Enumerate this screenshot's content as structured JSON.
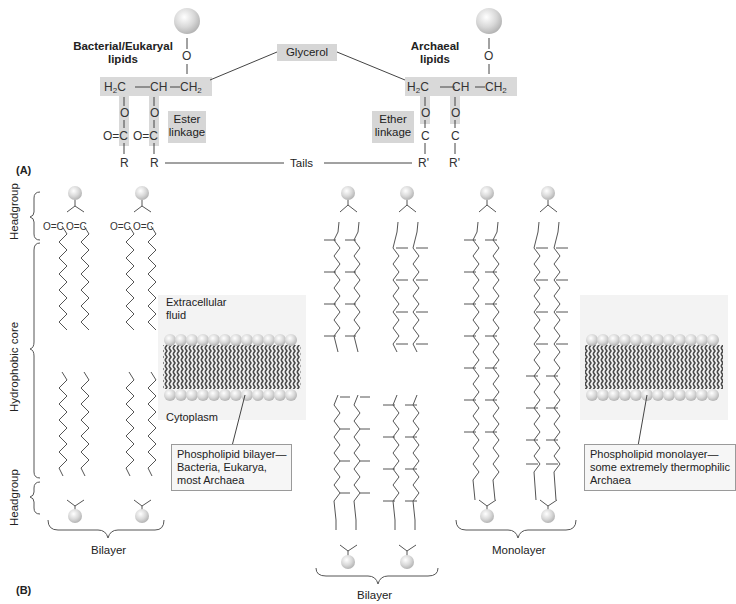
{
  "panel_a": {
    "label": "(A)",
    "bacterial_title_line1": "Bacterial/Eukaryal",
    "bacterial_title_line2": "lipids",
    "archaeal_title_line1": "Archaeal",
    "archaeal_title_line2": "lipids",
    "glycerol_label": "Glycerol",
    "tails_label": "Tails",
    "ester_label_line1": "Ester",
    "ester_label_line2": "linkage",
    "ether_label_line1": "Ether",
    "ether_label_line2": "linkage",
    "chem": {
      "o": "O",
      "h2c": "H",
      "ch": "CH",
      "ch2": "CH",
      "sub2": "2",
      "oc": "O=C",
      "c": "C",
      "r": "R",
      "r_prime": "R'"
    }
  },
  "panel_b": {
    "label": "(B)",
    "axis_labels": {
      "headgroup_top": "Headgroup",
      "hydrophobic_core": "Hydrophobic core",
      "headgroup_bottom": "Headgroup"
    },
    "bilayer_left_label": "Bilayer",
    "bilayer_middle_label": "Bilayer",
    "monolayer_label": "Monolayer",
    "bilayer_membrane": {
      "extracellular_line1": "Extracellular",
      "extracellular_line2": "fluid",
      "cytoplasm": "Cytoplasm",
      "callout_line1": "Phospholipid bilayer—",
      "callout_line2": "Bacteria, Eukarya,",
      "callout_line3": "most Archaea"
    },
    "monolayer_membrane": {
      "callout_line1": "Phospholipid monolayer—",
      "callout_line2": "some extremely thermophilic",
      "callout_line3": "Archaea"
    }
  },
  "colors": {
    "highlight_gray": "#d9d9d9",
    "headgroup_sphere": "#cfcfcf",
    "tail_dark": "#555555",
    "line": "#555555"
  }
}
